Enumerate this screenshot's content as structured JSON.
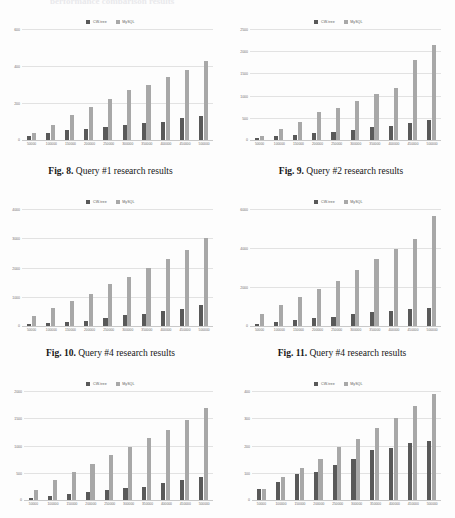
{
  "document": {
    "cut_heading": "performance comparison results",
    "legend_labels": {
      "series1": "CW-tree",
      "series2": "MySQL"
    },
    "colors": {
      "cw_tree": "#595959",
      "mysql": "#a8a8a8",
      "gridline": "#e2e2e2",
      "axis": "#c9c9c9"
    }
  },
  "captions": {
    "fig8": {
      "label": "Fig. 8.",
      "text": "Query #1 research results"
    },
    "fig9": {
      "label": "Fig. 9.",
      "text": "Query #2 research results"
    },
    "fig10": {
      "label": "Fig. 10.",
      "text": "Query #4 research results"
    },
    "fig11": {
      "label": "Fig. 11.",
      "text": "Query #4 research results"
    }
  },
  "chart_data": [
    {
      "id": "fig8",
      "type": "bar",
      "title": "",
      "xlabel": "",
      "ylabel": "",
      "categories": [
        "50000",
        "100000",
        "150000",
        "200000",
        "250000",
        "300000",
        "350000",
        "400000",
        "450000",
        "500000"
      ],
      "ylim": [
        0,
        600
      ],
      "yticks": [
        600,
        400,
        200,
        0
      ],
      "grid": true,
      "legend": [
        "CW-tree",
        "MySQL"
      ],
      "legend_position": "top-center",
      "series": [
        {
          "name": "CW-tree",
          "values": [
            22,
            38,
            52,
            58,
            68,
            80,
            92,
            100,
            118,
            132
          ]
        },
        {
          "name": "MySQL",
          "values": [
            37,
            80,
            135,
            180,
            222,
            268,
            300,
            338,
            378,
            428
          ]
        }
      ]
    },
    {
      "id": "fig9",
      "type": "bar",
      "title": "",
      "xlabel": "",
      "ylabel": "",
      "categories": [
        "50000",
        "100000",
        "150000",
        "200000",
        "250000",
        "300000",
        "350000",
        "400000",
        "450000",
        "500000"
      ],
      "ylim": [
        0,
        2500
      ],
      "yticks": [
        2500,
        2000,
        1500,
        1000,
        500,
        0
      ],
      "grid": true,
      "legend": [
        "CW-tree",
        "MySQL"
      ],
      "legend_position": "top-center",
      "series": [
        {
          "name": "CW-tree",
          "values": [
            40,
            80,
            110,
            150,
            180,
            230,
            290,
            310,
            390,
            450
          ]
        },
        {
          "name": "MySQL",
          "values": [
            95,
            250,
            410,
            625,
            730,
            880,
            1035,
            1175,
            1810,
            2140
          ]
        }
      ]
    },
    {
      "id": "fig10",
      "type": "bar",
      "title": "",
      "xlabel": "",
      "ylabel": "",
      "categories": [
        "50000",
        "100000",
        "150000",
        "200000",
        "250000",
        "300000",
        "350000",
        "400000",
        "450000",
        "500000"
      ],
      "ylim": [
        0,
        4000
      ],
      "yticks": [
        4000,
        3000,
        2000,
        1000,
        0
      ],
      "grid": true,
      "legend": [
        "CW-tree",
        "MySQL"
      ],
      "legend_position": "top-center",
      "series": [
        {
          "name": "CW-tree",
          "values": [
            60,
            90,
            140,
            185,
            290,
            390,
            425,
            500,
            565,
            730
          ]
        },
        {
          "name": "MySQL",
          "values": [
            330,
            600,
            855,
            1110,
            1420,
            1690,
            1995,
            2290,
            2605,
            3000
          ]
        }
      ]
    },
    {
      "id": "fig11",
      "type": "bar",
      "title": "",
      "xlabel": "",
      "ylabel": "",
      "categories": [
        "50000",
        "100000",
        "150000",
        "200000",
        "250000",
        "300000",
        "350000",
        "400000",
        "450000",
        "500000"
      ],
      "ylim": [
        0,
        6000
      ],
      "yticks": [
        6000,
        4000,
        2000,
        0
      ],
      "grid": true,
      "legend": [
        "CW-tree",
        "MySQL"
      ],
      "legend_position": "top-center",
      "series": [
        {
          "name": "CW-tree",
          "values": [
            110,
            230,
            300,
            390,
            470,
            600,
            700,
            790,
            860,
            930
          ]
        },
        {
          "name": "MySQL",
          "values": [
            600,
            1060,
            1480,
            1900,
            2320,
            2870,
            3430,
            3940,
            4470,
            5620
          ]
        }
      ]
    },
    {
      "id": "fig12",
      "type": "bar",
      "title": "",
      "xlabel": "",
      "ylabel": "",
      "categories": [
        "50000",
        "100000",
        "150000",
        "200000",
        "250000",
        "300000",
        "350000",
        "400000",
        "450000",
        "500000"
      ],
      "ylim": [
        0,
        2000
      ],
      "yticks": [
        2000,
        1500,
        1000,
        500,
        0
      ],
      "grid": true,
      "legend": [
        "CW-tree",
        "MySQL"
      ],
      "legend_position": "top-center",
      "series": [
        {
          "name": "CW-tree",
          "values": [
            40,
            80,
            110,
            145,
            175,
            215,
            240,
            320,
            375,
            420
          ]
        },
        {
          "name": "MySQL",
          "values": [
            180,
            375,
            510,
            670,
            830,
            965,
            1140,
            1290,
            1465,
            1690
          ]
        }
      ]
    },
    {
      "id": "fig13",
      "type": "bar",
      "title": "",
      "xlabel": "",
      "ylabel": "",
      "categories": [
        "50000",
        "100000",
        "150000",
        "200000",
        "250000",
        "300000",
        "350000",
        "400000",
        "450000",
        "500000"
      ],
      "ylim": [
        0,
        400
      ],
      "yticks": [
        400,
        300,
        200,
        100,
        0
      ],
      "grid": true,
      "legend": [
        "CW-tree",
        "MySQL"
      ],
      "legend_position": "top-center",
      "series": [
        {
          "name": "CW-tree",
          "values": [
            42,
            66,
            96,
            101,
            129,
            151,
            182,
            191,
            211,
            216
          ]
        },
        {
          "name": "MySQL",
          "values": [
            40,
            85,
            117,
            152,
            195,
            225,
            265,
            301,
            344,
            388
          ]
        }
      ]
    }
  ]
}
